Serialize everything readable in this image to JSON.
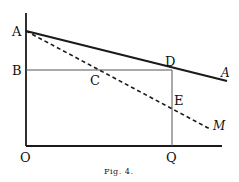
{
  "figure": {
    "caption": "Fig. 4.",
    "points": {
      "A": "A",
      "B": "B",
      "C": "C",
      "D": "D",
      "E": "E",
      "O": "O",
      "Q": "Q",
      "A_end": "A",
      "M": "M"
    },
    "colors": {
      "ink": "#1a1a1a",
      "thin": "#555555"
    }
  }
}
